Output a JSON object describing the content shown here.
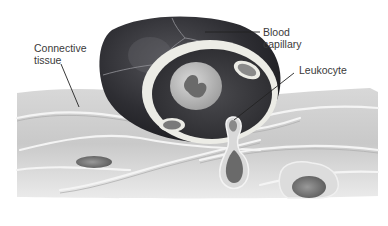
{
  "figure": {
    "labels": {
      "connective_tissue": "Connective\ntissue",
      "blood_capillary": "Blood\ncapillary",
      "leukocyte": "Leukocyte"
    },
    "colors": {
      "capillary_wall": "#2b2b2f",
      "capillary_lumen_lining": "#e9e9e4",
      "tissue": "#cfcfcf",
      "fibers": "#f2f2f2",
      "cell_nucleus": "#6d6d6d",
      "leader_line": "#222222",
      "background": "#ffffff"
    }
  }
}
